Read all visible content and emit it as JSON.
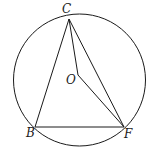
{
  "diagram": {
    "type": "geometry",
    "stroke_color": "#1a1a1a",
    "background": "#ffffff",
    "circle": {
      "center": "O",
      "cx": 79.5,
      "cy": 80,
      "r": 66
    },
    "points": {
      "C": {
        "label": "C",
        "x": 69,
        "y": 19,
        "label_x": 62,
        "label_y": 13
      },
      "B": {
        "label": "B",
        "x": 35,
        "y": 127,
        "label_x": 26,
        "label_y": 137
      },
      "F": {
        "label": "F",
        "x": 124,
        "y": 127,
        "label_x": 124,
        "label_y": 138
      },
      "O": {
        "label": "O",
        "x": 78,
        "y": 75,
        "label_x": 66,
        "label_y": 84
      }
    },
    "segments": [
      [
        "C",
        "B"
      ],
      [
        "C",
        "F"
      ],
      [
        "B",
        "F"
      ],
      [
        "C",
        "O"
      ],
      [
        "O",
        "F"
      ]
    ]
  }
}
